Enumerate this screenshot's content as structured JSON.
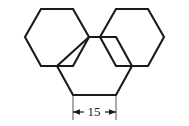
{
  "figure": {
    "background_color": "#ffffff",
    "stroke_color": "#1a1a1a",
    "shapes": [
      {
        "name": "left-upper-hexagon",
        "points": "41,9 73,9 89,37 73,66 41,66 25,37"
      },
      {
        "name": "right-upper-hexagon",
        "points": "116,9 148,9 164,37 148,66 116,66 100,37"
      },
      {
        "name": "center-lower-hexagon",
        "points": "89,37 116,37 132,66 116,95 73,95 57,66"
      }
    ],
    "dimension": {
      "name": "width-dimension",
      "label": "15",
      "label_x": 94,
      "label_y": 117,
      "line_y": 112,
      "x_start": 73,
      "x_end": 116,
      "ext_top": 95,
      "ext_bottom": 120,
      "arrow_size": 5
    }
  }
}
